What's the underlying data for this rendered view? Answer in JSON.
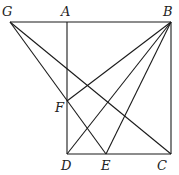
{
  "diagram": {
    "type": "geometry",
    "points": {
      "G": {
        "x": 10,
        "y": 22,
        "lx": 2,
        "ly": 16
      },
      "A": {
        "x": 67,
        "y": 22,
        "lx": 61,
        "ly": 16
      },
      "B": {
        "x": 171,
        "y": 22,
        "lx": 163,
        "ly": 16
      },
      "F": {
        "x": 67,
        "y": 101,
        "lx": 55,
        "ly": 112
      },
      "D": {
        "x": 67,
        "y": 154,
        "lx": 61,
        "ly": 170
      },
      "E": {
        "x": 106,
        "y": 154,
        "lx": 101,
        "ly": 170
      },
      "C": {
        "x": 171,
        "y": 154,
        "lx": 157,
        "ly": 170
      }
    },
    "labels": [
      "G",
      "A",
      "B",
      "F",
      "D",
      "E",
      "C"
    ],
    "segments": [
      [
        "G",
        "B"
      ],
      [
        "A",
        "D"
      ],
      [
        "B",
        "C"
      ],
      [
        "D",
        "C"
      ],
      [
        "G",
        "E"
      ],
      [
        "G",
        "C"
      ],
      [
        "B",
        "F"
      ],
      [
        "B",
        "D"
      ],
      [
        "B",
        "E"
      ]
    ]
  }
}
